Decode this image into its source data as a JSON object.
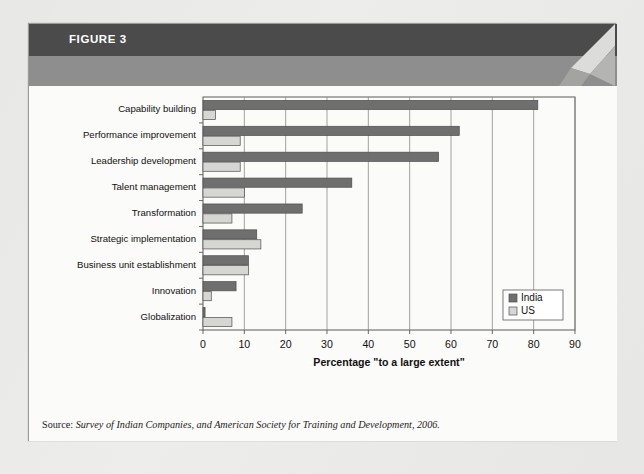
{
  "figure": {
    "label": "FIGURE 3",
    "subtitle": "How the Learning Function Provides Strategic Value to the Organization",
    "source_label": "Source:",
    "source_text": "Survey of Indian Companies, and American Society for Training and Development, 2006."
  },
  "colors": {
    "header_dark": "#4b4b4b",
    "header_mid": "#8e8e8e",
    "india_bar": "#6f6f6f",
    "us_bar": "#d6d6d2",
    "bar_outline": "#4d4d4d",
    "gridline": "#8a8a86",
    "axis": "#5a5a58",
    "panel": "#fbfbf9",
    "page": "#ececea"
  },
  "chart_data": {
    "type": "bar",
    "orientation": "horizontal",
    "title": "How the Learning Function Provides Strategic Value to the Organization",
    "xlabel": "Percentage \"to a large extent\"",
    "ylabel": "",
    "xlim": [
      0,
      90
    ],
    "xticks": [
      0,
      10,
      20,
      30,
      40,
      50,
      60,
      70,
      80,
      90
    ],
    "xtick_labels": [
      "0",
      "10",
      "20",
      "30",
      "40",
      "50",
      "60",
      "70",
      "80",
      "90"
    ],
    "grid": true,
    "grid_axis": "x",
    "legend_position": "lower right",
    "categories": [
      "Capability building",
      "Performance improvement",
      "Leadership development",
      "Talent management",
      "Transformation",
      "Strategic implementation",
      "Business unit establishment",
      "Innovation",
      "Globalization"
    ],
    "series": [
      {
        "name": "India",
        "color": "#6f6f6f",
        "values": [
          81,
          62,
          57,
          36,
          24,
          13,
          11,
          8,
          0.5
        ]
      },
      {
        "name": "US",
        "color": "#d6d6d2",
        "values": [
          3,
          9,
          9,
          10,
          7,
          14,
          11,
          2,
          7
        ]
      }
    ]
  }
}
